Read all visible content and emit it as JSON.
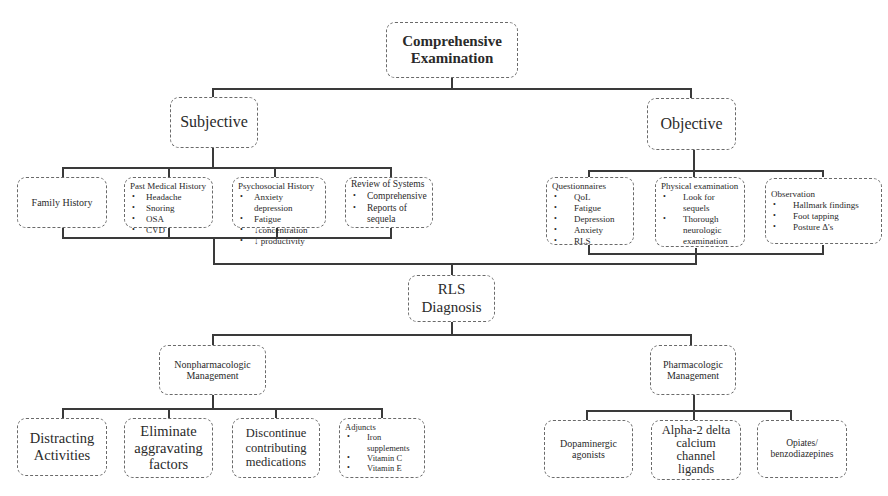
{
  "root": {
    "label_line1": "Comprehensive",
    "label_line2": "Examination"
  },
  "subjective": {
    "label": "Subjective",
    "children": {
      "family_history": {
        "label": "Family  History"
      },
      "past_medical_history": {
        "title": "Past Medical History",
        "items": [
          "Headache",
          "Snoring",
          "OSA",
          "CVD"
        ]
      },
      "psychosocial_history": {
        "title": "Psychosocial History",
        "items": [
          "Anxiety depression",
          "Fatigue",
          "↓concentration",
          "↓ productivity"
        ]
      },
      "review_of_systems": {
        "title": "Review of Systems",
        "items": [
          "Comprehensive",
          "Reports of sequela"
        ]
      }
    }
  },
  "objective": {
    "label": "Objective",
    "children": {
      "questionnaires": {
        "title": "Questionnaires",
        "items": [
          "QoL",
          "Fatigue",
          "Depression",
          "Anxiety",
          "RLS"
        ]
      },
      "physical_examination": {
        "title": "Physical examination",
        "items": [
          "Look for sequels",
          "Thorough neurologic examination"
        ]
      },
      "observation": {
        "title": "Observation",
        "items": [
          "Hallmark  findings",
          "Foot tapping",
          "Posture Δ's"
        ]
      }
    }
  },
  "diagnosis": {
    "label_line1": "RLS",
    "label_line2": "Diagnosis"
  },
  "nonpharmacologic": {
    "label_line1": "Nonpharmacologic",
    "label_line2": "Management",
    "children": {
      "distracting": {
        "label": "Distracting Activities"
      },
      "eliminate": {
        "label": "Eliminate aggravating factors"
      },
      "discontinue": {
        "label": "Discontinue contributing medications"
      },
      "adjuncts": {
        "title": "Adjuncts",
        "items": [
          "Iron supplements",
          "Vitamin  C",
          "Vitamin  E"
        ]
      }
    }
  },
  "pharmacologic": {
    "label_line1": "Pharmacologic",
    "label_line2": "Management",
    "children": {
      "dopaminergic": {
        "label": "Dopaminergic agonists"
      },
      "alpha2": {
        "label": "Alpha-2 delta calcium channel ligands"
      },
      "opiates": {
        "label": "Opiates/ benzodiazepines"
      }
    }
  },
  "colors": {
    "line": "#3a3a3a",
    "box_border": "#6a6a6a",
    "text": "#2a2a2a",
    "background": "#ffffff"
  }
}
